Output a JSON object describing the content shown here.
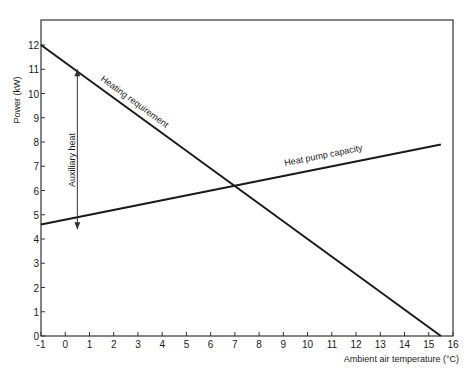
{
  "chart_data": {
    "type": "line",
    "title": "",
    "xlabel": "Ambient air temperature (°C)",
    "ylabel": "Power (kW)",
    "xlim": [
      -1,
      16
    ],
    "ylim": [
      0,
      13
    ],
    "x_ticks": [
      -1,
      0,
      1,
      2,
      3,
      4,
      5,
      6,
      7,
      8,
      9,
      10,
      11,
      12,
      13,
      14,
      15,
      16
    ],
    "y_ticks": [
      0,
      1,
      2,
      3,
      4,
      5,
      6,
      7,
      8,
      9,
      10,
      11,
      12
    ],
    "grid": false,
    "series": [
      {
        "name": "Heating requirement",
        "x": [
          -1,
          15.5
        ],
        "values": [
          12,
          0
        ]
      },
      {
        "name": "Heat pump capacity",
        "x": [
          -1,
          15.5
        ],
        "values": [
          4.6,
          7.9
        ]
      }
    ],
    "annotations": [
      {
        "text": "Auxiliary heat",
        "type": "double-arrow",
        "x": 0.5,
        "y_from": 4.9,
        "y_to": 11.0
      }
    ],
    "intersection": {
      "x": 7,
      "y": 6.2
    }
  },
  "labels": {
    "heating": "Heating requirement",
    "capacity": "Heat pump capacity",
    "auxiliary": "Auxiliary heat",
    "xlabel": "Ambient air temperature (°C)",
    "ylabel": "Power (kW)"
  },
  "colors": {
    "line": "#1a1a1a",
    "frame": "#333333",
    "background": "#ffffff"
  }
}
